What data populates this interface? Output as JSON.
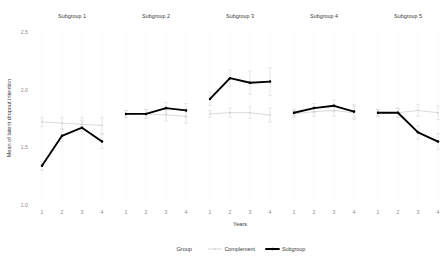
{
  "chart_data": {
    "type": "line",
    "title": "",
    "subtitle": "",
    "xlabel": "Years",
    "ylabel": "Mean of latent dropout intention",
    "ylim": [
      1.0,
      2.5
    ],
    "yticks": [
      "1.0",
      "1.5",
      "2.0",
      "2.5"
    ],
    "ytick_values": [
      1.0,
      1.5,
      2.0,
      2.5
    ],
    "x": [
      1,
      2,
      3,
      4
    ],
    "xticks": [
      "1",
      "2",
      "3",
      "4"
    ],
    "grid": false,
    "legend_position": "bottom",
    "legend_title": "Group",
    "facet_labels": [
      "Subgroup 1",
      "Subgroup 2",
      "Subgroup 3",
      "Subgroup 4",
      "Subgroup 5"
    ],
    "colors": {
      "subgroup": "#000000",
      "complement": "#c8c8c8",
      "errorbar": "#d9d9d9"
    },
    "panels": [
      {
        "label": "Subgroup 1",
        "series": [
          {
            "name": "Subgroup",
            "values": [
              1.34,
              1.6,
              1.67,
              1.55
            ],
            "ci_low": [
              1.3,
              1.55,
              1.61,
              1.49
            ],
            "ci_high": [
              1.38,
              1.66,
              1.73,
              1.61
            ]
          },
          {
            "name": "Complement",
            "values": [
              1.72,
              1.71,
              1.7,
              1.69
            ],
            "ci_low": [
              1.68,
              1.66,
              1.64,
              1.62
            ],
            "ci_high": [
              1.76,
              1.76,
              1.76,
              1.76
            ]
          }
        ]
      },
      {
        "label": "Subgroup 2",
        "series": [
          {
            "name": "Subgroup",
            "values": [
              1.79,
              1.79,
              1.84,
              1.82
            ],
            "ci_low": [
              1.76,
              1.75,
              1.79,
              1.76
            ],
            "ci_high": [
              1.82,
              1.83,
              1.89,
              1.88
            ]
          },
          {
            "name": "Complement",
            "values": [
              1.79,
              1.79,
              1.78,
              1.77
            ],
            "ci_low": [
              1.76,
              1.75,
              1.73,
              1.71
            ],
            "ci_high": [
              1.82,
              1.83,
              1.83,
              1.83
            ]
          }
        ]
      },
      {
        "label": "Subgroup 3",
        "series": [
          {
            "name": "Subgroup",
            "values": [
              1.92,
              2.1,
              2.06,
              2.07
            ],
            "ci_low": [
              1.86,
              2.03,
              1.96,
              1.95
            ],
            "ci_high": [
              1.98,
              2.17,
              2.16,
              2.19
            ]
          },
          {
            "name": "Complement",
            "values": [
              1.79,
              1.8,
              1.8,
              1.78
            ],
            "ci_low": [
              1.76,
              1.76,
              1.75,
              1.72
            ],
            "ci_high": [
              1.82,
              1.84,
              1.85,
              1.84
            ]
          }
        ]
      },
      {
        "label": "Subgroup 4",
        "series": [
          {
            "name": "Subgroup",
            "values": [
              1.8,
              1.84,
              1.86,
              1.81
            ],
            "ci_low": [
              1.77,
              1.8,
              1.81,
              1.75
            ],
            "ci_high": [
              1.83,
              1.88,
              1.91,
              1.87
            ]
          },
          {
            "name": "Complement",
            "values": [
              1.79,
              1.81,
              1.82,
              1.8
            ],
            "ci_low": [
              1.76,
              1.77,
              1.77,
              1.74
            ],
            "ci_high": [
              1.82,
              1.85,
              1.87,
              1.86
            ]
          }
        ]
      },
      {
        "label": "Subgroup 5",
        "series": [
          {
            "name": "Subgroup",
            "values": [
              1.8,
              1.8,
              1.63,
              1.55
            ],
            "ci_low": [
              1.77,
              1.76,
              1.57,
              1.48
            ],
            "ci_high": [
              1.83,
              1.84,
              1.69,
              1.62
            ]
          },
          {
            "name": "Complement",
            "values": [
              1.8,
              1.8,
              1.82,
              1.8
            ],
            "ci_low": [
              1.77,
              1.76,
              1.77,
              1.74
            ],
            "ci_high": [
              1.83,
              1.84,
              1.87,
              1.86
            ]
          }
        ]
      }
    ],
    "legend_entries": [
      {
        "label": "Complement",
        "color": "#c8c8c8"
      },
      {
        "label": "Subgroup",
        "color": "#000000"
      }
    ]
  }
}
